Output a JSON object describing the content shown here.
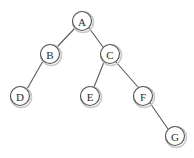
{
  "diagram": {
    "type": "binary-tree",
    "canvas": {
      "width": 194,
      "height": 158,
      "background": "#ffffff"
    },
    "style": {
      "node_fill": "#ffffff",
      "node_stroke": "#545454",
      "node_shadow_stroke": "#c9c9c9",
      "edge_stroke": "#5a5a5a",
      "label_color": "#2b2b2b",
      "node_radius": 9.5
    },
    "nodes": [
      {
        "id": "A",
        "label": "A",
        "cx": 82,
        "cy": 21,
        "r": 9.5,
        "level": 0,
        "parent": null,
        "side": "root"
      },
      {
        "id": "B",
        "label": "B",
        "cx": 50,
        "cy": 54,
        "r": 9.5,
        "level": 1,
        "parent": "A",
        "side": "left"
      },
      {
        "id": "C",
        "label": "C",
        "cx": 110,
        "cy": 54,
        "r": 9.5,
        "level": 1,
        "parent": "A",
        "side": "right"
      },
      {
        "id": "D",
        "label": "D",
        "cx": 20,
        "cy": 96,
        "r": 9.5,
        "level": 2,
        "parent": "B",
        "side": "left"
      },
      {
        "id": "E",
        "label": "E",
        "cx": 90,
        "cy": 96,
        "r": 9.5,
        "level": 2,
        "parent": "C",
        "side": "left"
      },
      {
        "id": "F",
        "label": "F",
        "cx": 143,
        "cy": 96,
        "r": 9.5,
        "level": 2,
        "parent": "C",
        "side": "right"
      },
      {
        "id": "G",
        "label": "G",
        "cx": 175,
        "cy": 136,
        "r": 9.5,
        "level": 3,
        "parent": "F",
        "side": "right"
      }
    ],
    "edges": [
      {
        "id": "A-B",
        "from": "A",
        "to": "B",
        "x1": 75,
        "y1": 28,
        "x2": 57,
        "y2": 47
      },
      {
        "id": "A-C",
        "from": "A",
        "to": "C",
        "x1": 89,
        "y1": 28,
        "x2": 103,
        "y2": 47
      },
      {
        "id": "B-D",
        "from": "B",
        "to": "D",
        "x1": 43,
        "y1": 61,
        "x2": 27,
        "y2": 89
      },
      {
        "id": "C-E",
        "from": "C",
        "to": "E",
        "x1": 104,
        "y1": 62,
        "x2": 94,
        "y2": 87
      },
      {
        "id": "C-F",
        "from": "C",
        "to": "F",
        "x1": 116,
        "y1": 62,
        "x2": 138,
        "y2": 87
      },
      {
        "id": "F-G",
        "from": "F",
        "to": "G",
        "x1": 150,
        "y1": 103,
        "x2": 168,
        "y2": 129
      }
    ]
  }
}
